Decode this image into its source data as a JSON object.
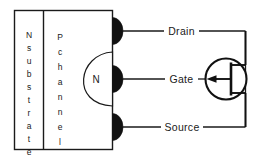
{
  "figure": {
    "type": "p-channel-jfet-cross-section-and-symbol",
    "background_color": "#ffffff",
    "line_color": "#1a1a1a",
    "contact_color": "#111111"
  },
  "device": {
    "substrate_label": "N substrate",
    "substrate_letters": [
      "N",
      "s",
      "u",
      "b",
      "s",
      "t",
      "r",
      "a",
      "t",
      "e"
    ],
    "channel_label": "P channel",
    "channel_letters": [
      "P",
      "c",
      "h",
      "a",
      "n",
      "n",
      "e",
      "l"
    ],
    "gate_region_label": "N"
  },
  "terminals": [
    {
      "name": "drain",
      "label": "Drain"
    },
    {
      "name": "gate",
      "label": "Gate"
    },
    {
      "name": "source",
      "label": "Source"
    }
  ],
  "symbol": {
    "name": "jfet-symbol",
    "arrow_direction": "left",
    "circle_enclosed": true
  }
}
